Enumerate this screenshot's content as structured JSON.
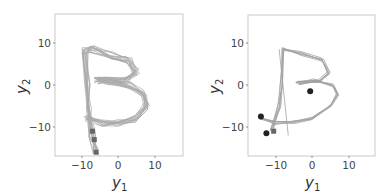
{
  "chart_data": [
    {
      "type": "line",
      "title": "",
      "xlabel": "y1",
      "ylabel": "y2",
      "xlim": [
        -17,
        17
      ],
      "ylim": [
        -17,
        17
      ],
      "xticks": [
        -10,
        0,
        10
      ],
      "yticks": [
        -10,
        0,
        10
      ],
      "grid": false,
      "description": "Many overlapping gray trajectories tracing the letter B; square markers near start (x≈-6, y from -10 to -16)",
      "series": [
        {
          "name": "trajectory-mean",
          "x": [
            -6,
            -7,
            -8,
            -8.5,
            -9,
            -7,
            -2,
            3,
            5,
            2,
            -3,
            -6,
            -3,
            3,
            7,
            8,
            5,
            0,
            -4,
            -8,
            -8.5
          ],
          "y": [
            -16,
            -12,
            -5,
            0,
            8,
            8.5,
            7,
            6,
            3,
            1,
            1,
            1,
            1,
            0,
            -2,
            -5,
            -8,
            -9,
            -9,
            -8,
            -8
          ]
        }
      ],
      "markers": [
        {
          "shape": "square",
          "x": -6,
          "y": -16
        },
        {
          "shape": "square",
          "x": -6.5,
          "y": -13
        },
        {
          "shape": "square",
          "x": -7,
          "y": -11
        }
      ]
    },
    {
      "type": "line",
      "title": "",
      "xlabel": "y1",
      "ylabel": "y2",
      "xlim": [
        -17,
        17
      ],
      "ylim": [
        -17,
        17
      ],
      "xticks": [
        -10,
        0,
        10
      ],
      "yticks": [
        -10,
        0,
        10
      ],
      "grid": false,
      "description": "Fewer gray trajectories tracing letter B with black circle end markers",
      "series": [
        {
          "name": "trajectory-mean",
          "x": [
            -11,
            -9,
            -8.5,
            -8,
            -3,
            3,
            4.5,
            2,
            -4,
            1,
            6,
            7,
            5,
            0,
            -5,
            -10,
            -14
          ],
          "y": [
            -11,
            -5,
            0,
            8.5,
            7.5,
            6,
            3,
            1,
            0.5,
            1,
            0,
            -2,
            -5,
            -8,
            -9,
            -9,
            -8
          ]
        },
        {
          "name": "straight-line",
          "x": [
            -9,
            -6.5
          ],
          "y": [
            8.5,
            -12
          ]
        }
      ],
      "markers": [
        {
          "shape": "circle",
          "x": -14,
          "y": -7.5
        },
        {
          "shape": "circle",
          "x": -12.5,
          "y": -11.5
        },
        {
          "shape": "circle",
          "x": -0.5,
          "y": -1.5
        },
        {
          "shape": "square",
          "x": -10.5,
          "y": -11
        }
      ]
    }
  ],
  "labels": {
    "x_main": "y",
    "x_sub": "1",
    "y_main": "y",
    "y_sub": "2",
    "ticks": [
      "-10",
      "0",
      "10"
    ]
  }
}
